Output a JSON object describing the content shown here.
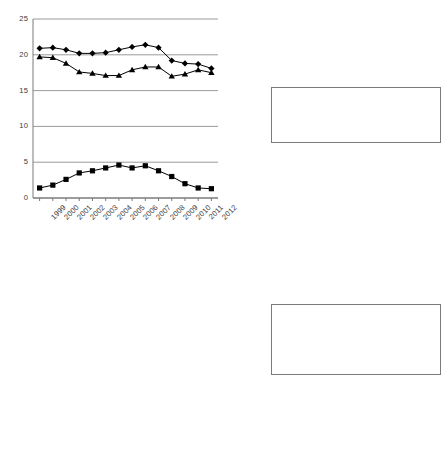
{
  "figure": {
    "background": "#ffffff",
    "axis_color": "#7a7a7a",
    "grid_color": "#9a9a9a",
    "series_color": "#000000"
  },
  "chart_data": [
    {
      "id": "top",
      "type": "line",
      "title": "",
      "xlabel": "",
      "ylabel": "",
      "grid": true,
      "legend_position": "right",
      "ylim": [
        0,
        25
      ],
      "yticks": [
        0,
        5,
        10,
        15,
        20,
        25
      ],
      "categories": [
        "1999",
        "2000",
        "2001",
        "2002",
        "2003",
        "2004",
        "2005",
        "2006",
        "2007",
        "2008",
        "2009",
        "2010",
        "2011",
        "2012"
      ],
      "series": [
        {
          "name": "Gross fixed capital formation in the euro area (not including Germany)",
          "marker": "diamond",
          "values": [
            20.9,
            21.0,
            20.7,
            20.2,
            20.2,
            20.3,
            20.7,
            21.1,
            21.4,
            21.0,
            19.2,
            18.8,
            18.7,
            18.1
          ]
        },
        {
          "name": "Gross fixed capital formation in Germany",
          "marker": "triangle",
          "values": [
            19.7,
            19.6,
            18.8,
            17.6,
            17.4,
            17.1,
            17.1,
            17.9,
            18.3,
            18.3,
            17.0,
            17.3,
            17.9,
            17.5
          ]
        },
        {
          "name": "Investment gap for Germany",
          "marker": "square",
          "values": [
            1.4,
            1.8,
            2.6,
            3.5,
            3.8,
            4.2,
            4.6,
            4.2,
            4.5,
            3.8,
            3.0,
            2.0,
            1.4,
            1.3
          ]
        }
      ]
    },
    {
      "id": "bottom",
      "type": "line",
      "title": "",
      "xlabel": "",
      "ylabel": "",
      "grid": true,
      "legend_position": "right",
      "ylim": [
        0,
        50
      ],
      "yticks": [
        0,
        5,
        10,
        15,
        20,
        25,
        30,
        35,
        40,
        45,
        50
      ],
      "categories": [
        "1999",
        "2000",
        "2001",
        "2002",
        "2003",
        "2004",
        "2005",
        "2006",
        "2007",
        "2008",
        "2009",
        "2010",
        "2011",
        "2012"
      ],
      "series": [
        {
          "name": "Gross fixed capital formation in the euro area (not including Germany)",
          "marker": "diamond",
          "values": [
            21.2,
            21.8,
            21.7,
            21.2,
            21.3,
            21.4,
            22.2,
            22.4,
            22.8,
            22.1,
            20.2,
            19.7,
            19.8,
            19.2
          ]
        },
        {
          "name": "Gross fixed capital formation in Germany",
          "marker": "triangle",
          "values": [
            19.9,
            19.9,
            18.8,
            17.6,
            17.5,
            17.6,
            17.2,
            18.0,
            18.3,
            18.3,
            17.0,
            17.4,
            18.0,
            17.6
          ]
        },
        {
          "name": "Cumulative investment gap for Germany",
          "marker": "square",
          "values": [
            1.6,
            3.4,
            5.9,
            9.6,
            13.3,
            17.6,
            22.2,
            26.3,
            31.0,
            34.8,
            37.9,
            40.1,
            41.5,
            42.3
          ]
        }
      ]
    }
  ],
  "charts": {
    "top": {
      "yticks": [
        "0",
        "5",
        "10",
        "15",
        "20",
        "25"
      ],
      "xticks": [
        "1999",
        "2000",
        "2001",
        "2002",
        "2003",
        "2004",
        "2005",
        "2006",
        "2007",
        "2008",
        "2009",
        "2010",
        "2011",
        "2012"
      ],
      "legend": [
        {
          "label": "Gross fixed capital formation in the euro area (not including Germany)",
          "marker": "diamond"
        },
        {
          "label": "Gross fixed capital formation in Germany",
          "marker": "triangle"
        },
        {
          "label": "Investment gap for Germany",
          "marker": "square"
        }
      ]
    },
    "bottom": {
      "yticks": [
        "0",
        "5",
        "10",
        "15",
        "20",
        "25",
        "30",
        "35",
        "40",
        "45",
        "50"
      ],
      "xticks": [
        "1999",
        "2000",
        "2001",
        "2002",
        "2003",
        "2004",
        "2005",
        "2006",
        "2007",
        "2008",
        "2009",
        "2010",
        "2011",
        "2012"
      ],
      "legend": [
        {
          "label": "Gross fixed capital formation in the euro area (not including Germany)",
          "marker": "diamond"
        },
        {
          "label": "Gross fixed capital formation in Germany",
          "marker": "triangle"
        },
        {
          "label": "Cumulative investment gap for Germany",
          "marker": "square"
        }
      ]
    }
  }
}
